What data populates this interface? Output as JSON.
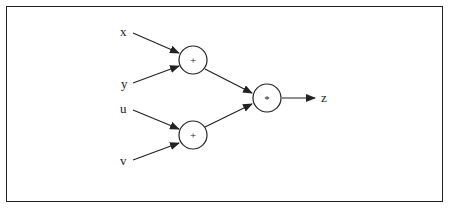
{
  "diagram": {
    "type": "computational-graph",
    "inputs": [
      {
        "id": "x",
        "label": "x"
      },
      {
        "id": "y",
        "label": "y"
      },
      {
        "id": "u",
        "label": "u"
      },
      {
        "id": "v",
        "label": "v"
      }
    ],
    "nodes": [
      {
        "id": "add1",
        "op": "+"
      },
      {
        "id": "add2",
        "op": "+"
      },
      {
        "id": "mul",
        "op": "*"
      }
    ],
    "output": {
      "id": "z",
      "label": "z"
    },
    "edges": [
      {
        "from": "x",
        "to": "add1"
      },
      {
        "from": "y",
        "to": "add1"
      },
      {
        "from": "u",
        "to": "add2"
      },
      {
        "from": "v",
        "to": "add2"
      },
      {
        "from": "add1",
        "to": "mul"
      },
      {
        "from": "add2",
        "to": "mul"
      },
      {
        "from": "mul",
        "to": "z"
      }
    ]
  }
}
